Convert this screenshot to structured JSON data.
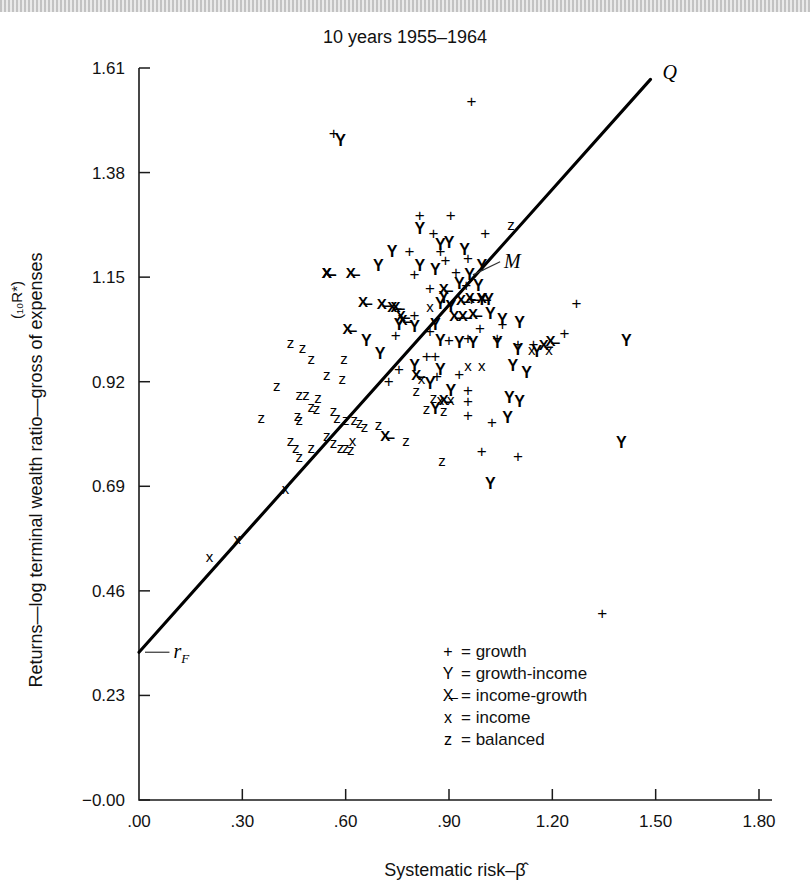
{
  "figure": {
    "title": "10 years 1955–1964",
    "y_axis_title_main": "Returns—log terminal wealth ratio—gross of expenses",
    "y_axis_title_sup": "(₁₀R*)",
    "x_axis_title": "Systematic risk–β̂",
    "line_label": "Q",
    "market_label": "M",
    "riskfree_label": "rᶠ",
    "riskfree_label_plain": "rF"
  },
  "legend": {
    "position": "inside-lower-center",
    "entries": [
      {
        "symbol": "+",
        "eq": "=",
        "label": "growth"
      },
      {
        "symbol": "Y",
        "eq": "=",
        "label": "growth-income"
      },
      {
        "symbol": "X̶",
        "eq": "=",
        "label": "income-growth"
      },
      {
        "symbol": "x",
        "eq": "=",
        "label": "income"
      },
      {
        "symbol": "z",
        "eq": "=",
        "label": "balanced"
      }
    ]
  },
  "colors": {
    "ink": "#111111",
    "line": "#000000",
    "background": "#ffffff",
    "topbar": "#b8b8b8"
  },
  "chart_data": {
    "type": "scatter",
    "title": "10 years 1955–1964",
    "xlabel": "Systematic risk–β̂",
    "ylabel": "Returns—log terminal wealth ratio—gross of expenses (₁₀R*)",
    "xlim": [
      0.0,
      1.8
    ],
    "ylim": [
      -0.0,
      1.61
    ],
    "xticks": [
      ".00",
      ".30",
      ".60",
      ".90",
      "1.20",
      "1.50",
      "1.80"
    ],
    "xtick_values": [
      0.0,
      0.3,
      0.6,
      0.9,
      1.2,
      1.5,
      1.8
    ],
    "yticks": [
      "−0.00",
      "0.23",
      "0.46",
      "0.69",
      "0.92",
      "1.15",
      "1.38",
      "1.61"
    ],
    "ytick_values": [
      0.0,
      0.23,
      0.46,
      0.69,
      0.92,
      1.15,
      1.38,
      1.61
    ],
    "grid": false,
    "fit_line": {
      "name": "Market line Q",
      "x0": 0.0,
      "y0": 0.325,
      "x1": 1.485,
      "y1": 1.585,
      "annotations": [
        {
          "label": "Q",
          "x": 1.52,
          "y": 1.6
        },
        {
          "label": "M",
          "x": 1.06,
          "y": 1.175,
          "marker_x": 0.955,
          "marker_y": 1.155
        },
        {
          "label": "rF",
          "x": 0.1,
          "y": 0.325,
          "marker_x": 0.0,
          "marker_y": 0.325
        }
      ]
    },
    "series": [
      {
        "name": "growth",
        "symbol": "+",
        "points": [
          [
            0.565,
            1.465
          ],
          [
            0.965,
            1.535
          ],
          [
            0.815,
            1.285
          ],
          [
            0.905,
            1.285
          ],
          [
            0.855,
            1.245
          ],
          [
            1.005,
            1.245
          ],
          [
            0.785,
            1.205
          ],
          [
            0.875,
            1.205
          ],
          [
            0.955,
            1.19
          ],
          [
            0.89,
            1.185
          ],
          [
            0.8,
            1.155
          ],
          [
            0.92,
            1.16
          ],
          [
            0.845,
            1.125
          ],
          [
            0.95,
            1.13
          ],
          [
            0.965,
            1.1
          ],
          [
            0.8,
            1.065
          ],
          [
            0.745,
            1.02
          ],
          [
            0.845,
            1.03
          ],
          [
            0.9,
            1.01
          ],
          [
            0.955,
            1.015
          ],
          [
            0.99,
            1.035
          ],
          [
            1.04,
            1.015
          ],
          [
            0.835,
            0.975
          ],
          [
            0.86,
            0.975
          ],
          [
            1.055,
            1.045
          ],
          [
            1.1,
            1.0
          ],
          [
            1.145,
            1.0
          ],
          [
            1.235,
            1.025
          ],
          [
            1.27,
            1.09
          ],
          [
            0.865,
            0.93
          ],
          [
            0.93,
            0.935
          ],
          [
            0.955,
            0.9
          ],
          [
            0.955,
            0.875
          ],
          [
            0.955,
            0.845
          ],
          [
            1.025,
            0.83
          ],
          [
            0.995,
            0.765
          ],
          [
            1.1,
            0.755
          ],
          [
            1.345,
            0.41
          ],
          [
            0.725,
            0.92
          ],
          [
            0.755,
            0.945
          ]
        ]
      },
      {
        "name": "growth-income",
        "symbol": "Y",
        "points": [
          [
            0.585,
            1.45
          ],
          [
            0.815,
            1.255
          ],
          [
            0.735,
            1.205
          ],
          [
            0.945,
            1.21
          ],
          [
            0.9,
            1.225
          ],
          [
            0.875,
            1.22
          ],
          [
            0.695,
            1.175
          ],
          [
            0.815,
            1.175
          ],
          [
            0.86,
            1.165
          ],
          [
            0.995,
            1.175
          ],
          [
            0.93,
            1.135
          ],
          [
            0.985,
            1.13
          ],
          [
            0.885,
            1.105
          ],
          [
            0.995,
            1.1
          ],
          [
            1.015,
            1.1
          ],
          [
            0.875,
            1.09
          ],
          [
            0.905,
            1.085
          ],
          [
            1.02,
            1.07
          ],
          [
            0.755,
            1.045
          ],
          [
            0.8,
            1.04
          ],
          [
            0.86,
            1.045
          ],
          [
            1.055,
            1.055
          ],
          [
            1.105,
            1.05
          ],
          [
            0.875,
            1.01
          ],
          [
            0.93,
            1.005
          ],
          [
            0.97,
            1.005
          ],
          [
            1.04,
            1.005
          ],
          [
            1.1,
            0.99
          ],
          [
            1.155,
            0.985
          ],
          [
            0.8,
            0.955
          ],
          [
            0.875,
            0.945
          ],
          [
            1.085,
            0.955
          ],
          [
            1.125,
            0.94
          ],
          [
            0.845,
            0.915
          ],
          [
            0.905,
            0.9
          ],
          [
            1.075,
            0.885
          ],
          [
            1.105,
            0.875
          ],
          [
            0.86,
            0.86
          ],
          [
            1.07,
            0.84
          ],
          [
            1.4,
            0.785
          ],
          [
            1.415,
            1.01
          ],
          [
            1.02,
            0.695
          ],
          [
            0.66,
            1.01
          ],
          [
            0.7,
            0.98
          ],
          [
            0.96,
            1.155
          ]
        ]
      },
      {
        "name": "income-growth",
        "symbol": "X̶",
        "points": [
          [
            0.545,
            1.16
          ],
          [
            0.615,
            1.16
          ],
          [
            0.65,
            1.095
          ],
          [
            0.705,
            1.09
          ],
          [
            0.735,
            1.085
          ],
          [
            0.745,
            1.085
          ],
          [
            0.885,
            1.125
          ],
          [
            0.935,
            1.1
          ],
          [
            0.96,
            1.105
          ],
          [
            0.995,
            1.105
          ],
          [
            0.605,
            1.035
          ],
          [
            0.76,
            1.065
          ],
          [
            0.765,
            1.055
          ],
          [
            0.915,
            1.065
          ],
          [
            0.97,
            1.07
          ],
          [
            0.94,
            1.065
          ],
          [
            0.805,
            0.935
          ],
          [
            0.885,
            0.88
          ],
          [
            1.175,
            1.0
          ],
          [
            1.195,
            1.01
          ],
          [
            0.715,
            0.8
          ],
          [
            0.545,
            1.16
          ]
        ]
      },
      {
        "name": "income",
        "symbol": "x",
        "points": [
          [
            0.205,
            0.535
          ],
          [
            0.285,
            0.575
          ],
          [
            0.425,
            0.685
          ],
          [
            0.845,
            1.085
          ],
          [
            0.82,
            0.925
          ],
          [
            0.955,
            0.955
          ],
          [
            0.995,
            0.955
          ],
          [
            1.14,
            0.99
          ],
          [
            1.19,
            0.99
          ],
          [
            0.875,
            0.88
          ],
          [
            0.905,
            0.88
          ],
          [
            0.62,
            0.79
          ]
        ]
      },
      {
        "name": "balanced",
        "symbol": "z",
        "points": [
          [
            0.44,
            1.005
          ],
          [
            0.475,
            0.995
          ],
          [
            0.5,
            0.97
          ],
          [
            0.595,
            0.97
          ],
          [
            0.545,
            0.935
          ],
          [
            0.59,
            0.925
          ],
          [
            0.4,
            0.91
          ],
          [
            0.465,
            0.89
          ],
          [
            0.485,
            0.89
          ],
          [
            0.52,
            0.885
          ],
          [
            0.5,
            0.865
          ],
          [
            0.515,
            0.86
          ],
          [
            0.355,
            0.84
          ],
          [
            0.46,
            0.845
          ],
          [
            0.465,
            0.835
          ],
          [
            0.565,
            0.855
          ],
          [
            0.575,
            0.84
          ],
          [
            0.6,
            0.835
          ],
          [
            0.625,
            0.835
          ],
          [
            0.64,
            0.83
          ],
          [
            0.655,
            0.82
          ],
          [
            0.695,
            0.825
          ],
          [
            0.805,
            0.9
          ],
          [
            0.855,
            0.885
          ],
          [
            0.885,
            0.855
          ],
          [
            0.44,
            0.79
          ],
          [
            0.455,
            0.775
          ],
          [
            0.5,
            0.775
          ],
          [
            0.545,
            0.8
          ],
          [
            0.565,
            0.785
          ],
          [
            0.585,
            0.775
          ],
          [
            0.6,
            0.775
          ],
          [
            0.615,
            0.77
          ],
          [
            0.775,
            0.79
          ],
          [
            0.835,
            0.86
          ],
          [
            0.88,
            0.745
          ],
          [
            1.08,
            1.265
          ],
          [
            0.465,
            0.755
          ]
        ]
      }
    ]
  }
}
